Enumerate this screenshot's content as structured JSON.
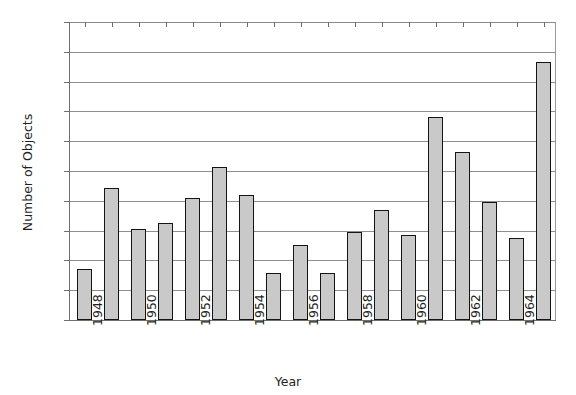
{
  "chart_data": {
    "type": "bar",
    "title": "",
    "xlabel": "Year",
    "ylabel": "Number of Objects",
    "ylim": [
      0,
      1000
    ],
    "ytick_step": 100,
    "grid": true,
    "legend": null,
    "bar_fill_color": "#c9c9c9",
    "bar_edge_color": "#141414",
    "axis_color": "#6f6f6f",
    "gridline_color": "#8e8e8e",
    "categories": [
      "1948",
      "1949",
      "1950",
      "1951",
      "1952",
      "1953",
      "1954",
      "1955",
      "1956",
      "1957",
      "1958",
      "1959",
      "1960",
      "1961",
      "1962",
      "1963",
      "1964",
      "1965"
    ],
    "values": [
      170,
      443,
      306,
      324,
      410,
      513,
      420,
      158,
      253,
      157,
      294,
      368,
      286,
      682,
      563,
      397,
      274,
      867
    ],
    "xtick_labels": [
      "1948",
      "1950",
      "1952",
      "1954",
      "1956",
      "1958",
      "1960",
      "1962",
      "1964"
    ],
    "ytick_labels": [
      "0",
      "100",
      "200",
      "300",
      "400",
      "500",
      "600",
      "700",
      "800",
      "900",
      "1000"
    ]
  },
  "artifact": {
    "clipped_top_text": ""
  }
}
